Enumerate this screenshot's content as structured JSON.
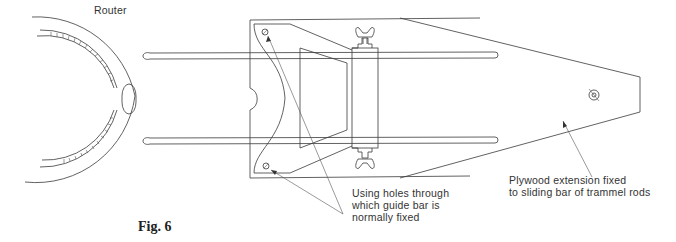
{
  "figure": {
    "caption": "Fig. 6"
  },
  "labels": {
    "router": "Router",
    "holes_note_line1": "Using holes through",
    "holes_note_line2": "which guide bar is",
    "holes_note_line3": "normally fixed",
    "plywood_note_line1": "Plywood extension fixed",
    "plywood_note_line2": "to sliding bar of trammel rods"
  },
  "colors": {
    "line": "#3a3a3a",
    "text": "#333333",
    "background": "#ffffff"
  }
}
